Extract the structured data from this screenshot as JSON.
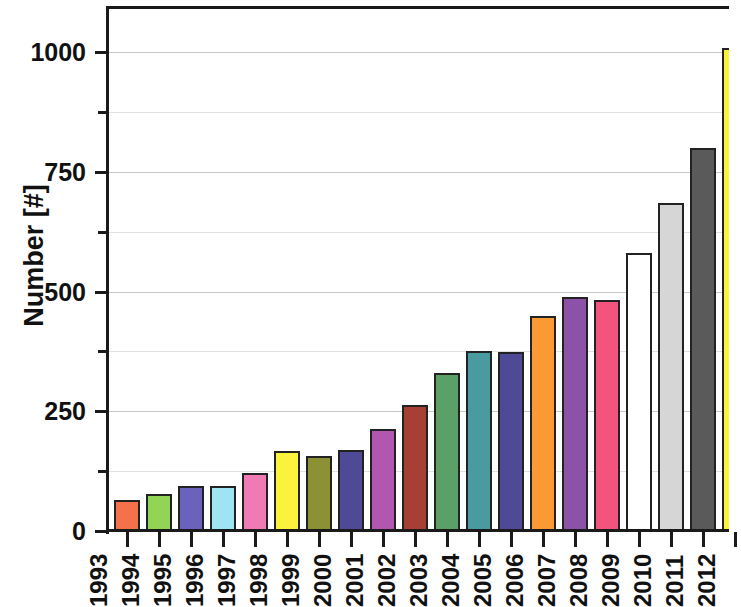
{
  "chart_data": {
    "type": "bar",
    "title": "",
    "xlabel": "",
    "ylabel": "Number [#]",
    "categories": [
      "1993",
      "1994",
      "1995",
      "1996",
      "1997",
      "1998",
      "1999",
      "2000",
      "2001",
      "2002",
      "2003",
      "2004",
      "2005",
      "2006",
      "2007",
      "2008",
      "2009",
      "2010",
      "2011",
      "2012"
    ],
    "values": [
      65,
      78,
      95,
      95,
      122,
      168,
      157,
      170,
      213,
      264,
      330,
      375,
      373,
      448,
      488,
      482,
      580,
      685,
      800,
      1008
    ],
    "bar_colors": [
      "#f4714a",
      "#92d456",
      "#6a62bb",
      "#9fe4f2",
      "#ef7ab4",
      "#fbf23c",
      "#8d9136",
      "#4f4a96",
      "#b157b0",
      "#a63f34",
      "#5ba066",
      "#4a9ba0",
      "#4f4a96",
      "#fb9a33",
      "#8b52a8",
      "#f4537e",
      "#ffffff",
      "#d6d6d6",
      "#5a5a5a",
      "#fbf23c"
    ],
    "ylim": [
      0,
      1070
    ],
    "yticks_major": [
      0,
      250,
      500,
      750,
      1000
    ],
    "yticks_major_labels": [
      "0",
      "250",
      "500",
      "750",
      "1000"
    ],
    "yticks_minor": [
      125,
      375,
      625,
      875
    ],
    "grid": true,
    "legend": "none",
    "note_clipped_right": true
  },
  "axes": {
    "y_title": "Number [#]"
  }
}
